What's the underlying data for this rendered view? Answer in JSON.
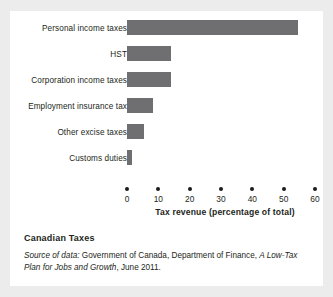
{
  "card": {
    "background": "#ffffff",
    "page_background": "#ececed"
  },
  "chart_data": {
    "type": "bar",
    "orientation": "horizontal",
    "title": "Canadian Taxes",
    "xlabel": "Tax revenue (percentage of total)",
    "ylabel": "",
    "xlim": [
      0,
      60
    ],
    "xticks": [
      0,
      10,
      20,
      30,
      40,
      50,
      60
    ],
    "xtick_labels": [
      "0",
      "10",
      "20",
      "30",
      "40",
      "50",
      "60"
    ],
    "grid": false,
    "legend": false,
    "bar_color": "#6f6f71",
    "categories": [
      "Personal income taxes",
      "HST",
      "Corporation income taxes",
      "Employment insurance tax",
      "Other excise taxes",
      "Customs duties"
    ],
    "values": [
      54.6,
      14.2,
      14.2,
      8.3,
      5.3,
      1.6
    ],
    "series": [
      {
        "name": "Tax revenue (percentage of total)",
        "values": [
          54.6,
          14.2,
          14.2,
          8.3,
          5.3,
          1.6
        ]
      }
    ]
  },
  "caption": {
    "title": "Canadian Taxes",
    "source_lead": "Source of data:",
    "source_body": " Government of Canada, Department of Finance, ",
    "source_italic_work": "A Low-Tax Plan for Jobs and Growth",
    "source_tail": ", June 2011."
  }
}
